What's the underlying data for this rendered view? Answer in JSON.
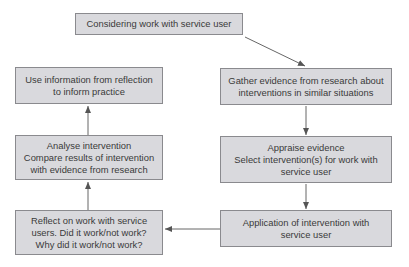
{
  "diagram": {
    "type": "flowchart",
    "nodes": [
      {
        "id": "considering",
        "lines": [
          "Considering work with service user"
        ]
      },
      {
        "id": "gather",
        "lines": [
          "Gather evidence from research about",
          "interventions in similar situations"
        ]
      },
      {
        "id": "appraise",
        "lines": [
          "Appraise evidence",
          "Select intervention(s) for work with",
          "service user"
        ]
      },
      {
        "id": "application",
        "lines": [
          "Application of intervention with",
          "service user"
        ]
      },
      {
        "id": "reflect",
        "lines": [
          "Reflect on work with service",
          "users. Did it work/not work?",
          "Why did it work/not work?"
        ]
      },
      {
        "id": "analyse",
        "lines": [
          "Analyse intervention",
          "Compare results of intervention",
          "with evidence from research"
        ]
      },
      {
        "id": "use-info",
        "lines": [
          "Use information from reflection",
          "to inform practice"
        ]
      }
    ],
    "edges": [
      {
        "from": "considering",
        "to": "gather"
      },
      {
        "from": "gather",
        "to": "appraise"
      },
      {
        "from": "appraise",
        "to": "application"
      },
      {
        "from": "application",
        "to": "reflect"
      },
      {
        "from": "reflect",
        "to": "analyse"
      },
      {
        "from": "analyse",
        "to": "use-info"
      }
    ],
    "colors": {
      "box_fill": "#d9d9dd",
      "box_border": "#8a8a8e",
      "arrow": "#555555",
      "text": "#3a3a3a"
    }
  }
}
